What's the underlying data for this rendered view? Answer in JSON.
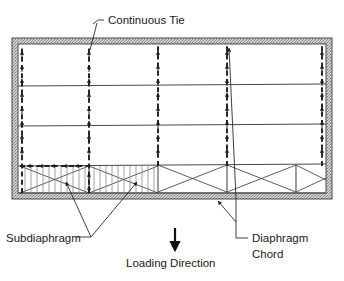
{
  "figure": {
    "kind": "structural-diaphragm-plan-diagram",
    "background_color": "#ffffff",
    "line_color": "#3a3a3a",
    "wall_fill_color": "#c9c9c9",
    "text_color": "#1a1a1a"
  },
  "labels": {
    "continuous_tie": "Continuous Tie",
    "subdiaphragm": "Subdiaphragm",
    "loading_direction": "Loading Direction",
    "diaphragm_chord_line1": "Diaphragm",
    "diaphragm_chord_line2": "Chord"
  },
  "geometry": {
    "frame": {
      "x": 12,
      "y": 38,
      "width": 320,
      "height": 161
    },
    "wall_thickness": 6,
    "bay_x_positions": [
      20,
      89,
      158,
      227,
      296,
      324
    ],
    "tie_x_positions": [
      22,
      89,
      158,
      227,
      322
    ],
    "beam_y_positions": [
      84,
      124,
      164
    ],
    "subdiaphragm_bays": [
      0,
      1
    ],
    "braced_bays": [
      0,
      1,
      2,
      3
    ],
    "bottom_strip": {
      "top": 164,
      "bottom": 193
    }
  },
  "annotations": [
    {
      "name": "continuous-tie",
      "text": "Continuous Tie",
      "anchor_x": 104,
      "anchor_y": 22
    },
    {
      "name": "subdiaphragm",
      "text": "Subdiaphragm",
      "anchor_x": 6,
      "anchor_y": 239
    },
    {
      "name": "loading-direction",
      "text": "Loading Direction",
      "anchor_x": 126,
      "anchor_y": 264
    },
    {
      "name": "diaphragm-chord",
      "text": "Diaphragm Chord",
      "anchor_x": 255,
      "anchor_y": 240
    }
  ]
}
